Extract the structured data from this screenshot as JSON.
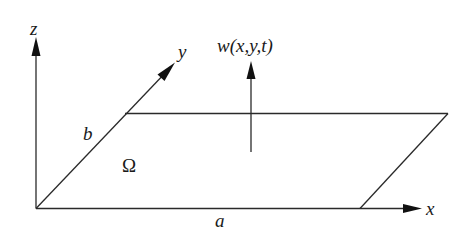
{
  "diagram": {
    "labels": {
      "z_axis": "z",
      "y_axis": "y",
      "x_axis": "x",
      "displacement": "w(x,y,t)",
      "width_b": "b",
      "length_a": "a",
      "domain": "Ω"
    },
    "geometry": {
      "origin": [
        36,
        208
      ],
      "z_axis_tip": [
        36,
        38
      ],
      "y_axis_tip": [
        175,
        63
      ],
      "x_axis_tip": [
        422,
        209
      ],
      "plate_corners": [
        [
          36,
          208
        ],
        [
          360,
          208
        ],
        [
          448,
          113
        ],
        [
          125,
          113
        ]
      ],
      "w_arrow_base": [
        251,
        152
      ],
      "w_arrow_tip": [
        251,
        62
      ]
    },
    "colors": {
      "line": "#2a2a2a",
      "text": "#1a1a1a",
      "background": "#ffffff"
    }
  }
}
